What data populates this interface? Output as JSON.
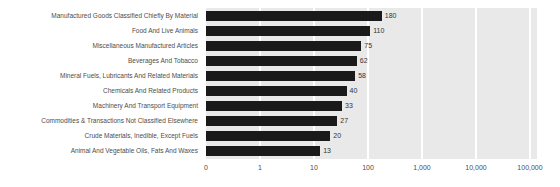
{
  "chart_data": {
    "type": "bar",
    "orientation": "horizontal",
    "title": "",
    "xlabel": "",
    "ylabel": "",
    "xscale": "log",
    "grid": true,
    "legend": null,
    "xticks": [
      "0",
      "1",
      "10",
      "100",
      "1,000",
      "10,000",
      "100,000"
    ],
    "xtick_values": [
      0,
      1,
      10,
      100,
      1000,
      10000,
      100000
    ],
    "xlim": [
      0,
      100000
    ],
    "categories": [
      "Manufactured Goods Classified Chiefly By Material",
      "Food And Live Animals",
      "Miscellaneous Manufactured Articles",
      "Beverages And Tobacco",
      "Mineral Fuels, Lubricants And Related Materials",
      "Chemicals And Related Products",
      "Machinery And Transport Equipment",
      "Commodities & Transactions Not Classified Elsewhere",
      "Crude Materials, Inedible, Except Fuels",
      "Animal And Vegetable Oils, Fats And Waxes"
    ],
    "values": [
      180,
      110,
      75,
      62,
      58,
      40,
      33,
      27,
      20,
      13
    ],
    "value_labels": [
      "180",
      "110",
      "75",
      "62",
      "58",
      "40",
      "33",
      "27",
      "20",
      "13"
    ],
    "colors": {
      "bar": "#1a1a1a",
      "plot_background": "#e9e9e9",
      "gridline": "#ffffff",
      "label_text": "#4d4d4d",
      "value_text": "#333333",
      "page_background": "#ffffff"
    }
  }
}
